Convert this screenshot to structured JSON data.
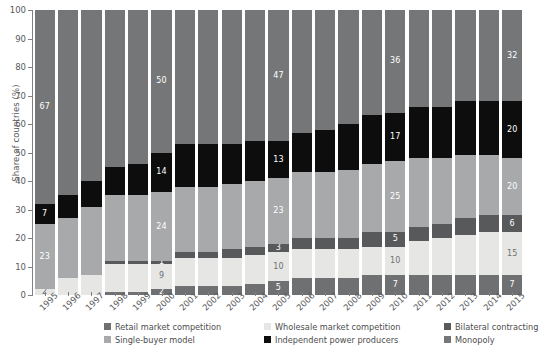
{
  "chart_data": {
    "type": "bar",
    "stacked": true,
    "title": "",
    "xlabel": "",
    "ylabel": "Share of countries (%)",
    "ylim": [
      0,
      100
    ],
    "yticks": [
      0,
      10,
      20,
      30,
      40,
      50,
      60,
      70,
      80,
      90,
      100
    ],
    "grid": false,
    "legend_position": "bottom",
    "categories": [
      "1995",
      "1996",
      "1997",
      "1998",
      "1999",
      "2000",
      "2001",
      "2002",
      "2003",
      "2004",
      "2005",
      "2006",
      "2007",
      "2008",
      "2009",
      "2010",
      "2011",
      "2012",
      "2013",
      "2014",
      "2015"
    ],
    "series": [
      {
        "name": "Retail market competition",
        "color": "#6f7072",
        "values": [
          0,
          0,
          0,
          1,
          1,
          2,
          3,
          3,
          3,
          4,
          5,
          6,
          6,
          6,
          7,
          7,
          7,
          7,
          7,
          7,
          7
        ],
        "labels": [
          "",
          "",
          "",
          "",
          "",
          "2",
          "",
          "",
          "",
          "",
          "5",
          "",
          "",
          "",
          "",
          "7",
          "",
          "",
          "",
          "",
          "7"
        ]
      },
      {
        "name": "Wholesale market competition",
        "color": "#e6e6e4",
        "values": [
          2,
          6,
          7,
          10,
          10,
          9,
          10,
          10,
          10,
          10,
          10,
          10,
          10,
          10,
          10,
          10,
          12,
          13,
          14,
          15,
          15
        ],
        "labels": [
          "2",
          "",
          "",
          "",
          "",
          "9",
          "",
          "",
          "",
          "",
          "10",
          "",
          "",
          "",
          "",
          "10",
          "",
          "",
          "",
          "",
          "15"
        ]
      },
      {
        "name": "Bilateral contracting",
        "color": "#58595b",
        "values": [
          0,
          0,
          0,
          1,
          1,
          1,
          2,
          2,
          3,
          3,
          3,
          4,
          4,
          4,
          5,
          5,
          5,
          5,
          6,
          6,
          6
        ],
        "labels": [
          "",
          "",
          "",
          "",
          "",
          "1",
          "",
          "",
          "",
          "",
          "3",
          "",
          "",
          "",
          "",
          "5",
          "",
          "",
          "",
          "",
          "6"
        ]
      },
      {
        "name": "Single-buyer model",
        "color": "#a7a9ab",
        "values": [
          23,
          21,
          24,
          23,
          23,
          24,
          23,
          23,
          23,
          23,
          23,
          23,
          23,
          24,
          24,
          25,
          24,
          23,
          22,
          21,
          20
        ],
        "labels": [
          "23",
          "",
          "",
          "",
          "",
          "24",
          "",
          "",
          "",
          "",
          "23",
          "",
          "",
          "",
          "",
          "25",
          "",
          "",
          "",
          "",
          "20"
        ]
      },
      {
        "name": "Independent power producers",
        "color": "#0d0d0d",
        "values": [
          7,
          8,
          9,
          10,
          11,
          14,
          15,
          15,
          14,
          14,
          13,
          14,
          15,
          16,
          17,
          17,
          18,
          18,
          19,
          19,
          20
        ],
        "labels": [
          "7",
          "",
          "",
          "",
          "",
          "14",
          "",
          "",
          "",
          "",
          "13",
          "",
          "",
          "",
          "",
          "17",
          "",
          "",
          "",
          "",
          "20"
        ]
      },
      {
        "name": "Monopoly",
        "color": "#757678",
        "values": [
          68,
          65,
          60,
          55,
          54,
          50,
          47,
          47,
          47,
          46,
          46,
          43,
          42,
          40,
          37,
          36,
          34,
          34,
          32,
          32,
          32
        ],
        "labels": [
          "67",
          "",
          "",
          "",
          "",
          "50",
          "",
          "",
          "",
          "",
          "47",
          "",
          "",
          "",
          "",
          "36",
          "",
          "",
          "",
          "",
          "32"
        ]
      }
    ]
  },
  "legend": {
    "items": [
      {
        "label": "Retail market competition",
        "color": "#6f7072"
      },
      {
        "label": "Wholesale market competition",
        "color": "#e6e6e4"
      },
      {
        "label": "Bilateral contracting",
        "color": "#58595b"
      },
      {
        "label": "Single-buyer model",
        "color": "#a7a9ab"
      },
      {
        "label": "Independent power producers",
        "color": "#0d0d0d"
      },
      {
        "label": "Monopoly",
        "color": "#757678"
      }
    ]
  },
  "axis": {
    "y_title": "Share of countries (%)",
    "y_ticks": [
      "100",
      "90",
      "80",
      "70",
      "60",
      "50",
      "40",
      "30",
      "20",
      "10",
      "0"
    ]
  }
}
